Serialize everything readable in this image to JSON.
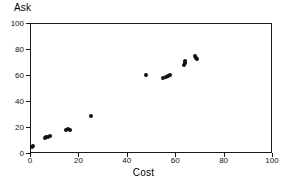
{
  "chart_data": {
    "type": "scatter",
    "title": "",
    "xlabel": "Cost",
    "ylabel": "Ask",
    "xlim": [
      0,
      100
    ],
    "ylim": [
      0,
      100
    ],
    "xticks": [
      0,
      20,
      40,
      60,
      80,
      100
    ],
    "yticks": [
      0,
      20,
      40,
      60,
      80,
      100
    ],
    "xtick_labels": [
      "0",
      "20",
      "40",
      "60",
      "80",
      "100"
    ],
    "ytick_labels": [
      "0",
      "20",
      "40",
      "60",
      "80",
      "100"
    ],
    "grid": false,
    "legend": null,
    "marker": "filled-circle",
    "marker_color": "#111111",
    "points": [
      {
        "x": 0.8,
        "y": 4.5
      },
      {
        "x": 1.2,
        "y": 5.5
      },
      {
        "x": 6.0,
        "y": 11.8
      },
      {
        "x": 6.8,
        "y": 12.3
      },
      {
        "x": 7.6,
        "y": 12.6
      },
      {
        "x": 8.2,
        "y": 12.8
      },
      {
        "x": 15.0,
        "y": 17.8
      },
      {
        "x": 15.8,
        "y": 18.2
      },
      {
        "x": 16.4,
        "y": 18.0
      },
      {
        "x": 25.2,
        "y": 28.8
      },
      {
        "x": 47.8,
        "y": 60.0
      },
      {
        "x": 54.8,
        "y": 57.8
      },
      {
        "x": 56.0,
        "y": 58.6
      },
      {
        "x": 57.0,
        "y": 59.6
      },
      {
        "x": 58.0,
        "y": 60.0
      },
      {
        "x": 63.8,
        "y": 67.6
      },
      {
        "x": 64.0,
        "y": 69.2
      },
      {
        "x": 64.2,
        "y": 70.4
      },
      {
        "x": 68.0,
        "y": 74.4
      },
      {
        "x": 68.6,
        "y": 73.4
      },
      {
        "x": 69.2,
        "y": 72.6
      }
    ]
  }
}
